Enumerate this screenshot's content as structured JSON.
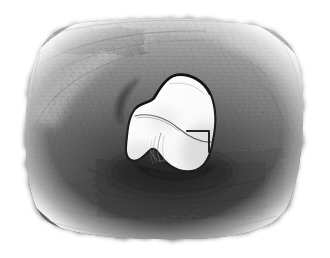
{
  "artwork": {
    "title": "Graphite sketch of a white rounded object on a dark shaded field",
    "medium": "pencil / graphite on white paper",
    "canvas": {
      "width": 330,
      "height": 258,
      "paper_color": "#ffffff"
    },
    "background_field": {
      "name": "shaded-rounded-rectangle",
      "shape": "rounded rectangle with irregular hand-drawn edges",
      "bounds": {
        "x": 26,
        "y": 20,
        "width": 278,
        "height": 218
      },
      "corner_radius": 52,
      "tone_light": "#b9b9b9",
      "tone_mid": "#8e8e8e",
      "tone_dark": "#5d5d5d",
      "tone_darkest": "#3a3a3a",
      "texture": "diagonal and horizontal graphite hatching, smudged",
      "notes": "Lighter along top and upper-left rim, darkest in lower-middle beneath the object"
    },
    "subject": {
      "name": "white-rounded-object",
      "description": "Irregular two-lobed white form resembling a molar tooth or pebble",
      "fill": "#fdfdfd",
      "outline_color": "#1c1c1c",
      "bounds": {
        "x": 128,
        "y": 74,
        "width": 88,
        "height": 98
      },
      "interior_lines": [
        "long curved ridge sweeping from upper-left lobe toward the right",
        "short hooked L-shaped mark on the right side",
        "faint scribbled crease near the lower-middle"
      ]
    },
    "cast_shadow": {
      "name": "cast-shadow",
      "color": "#2b2b2b",
      "position": "directly below and around the lower edge of the white object"
    }
  }
}
